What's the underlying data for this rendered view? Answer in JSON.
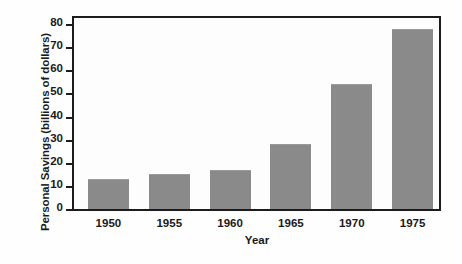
{
  "chart_data": {
    "type": "bar",
    "title": "",
    "xlabel": "Year",
    "ylabel": "Personal Savings (billions of dollars)",
    "categories": [
      "1950",
      "1955",
      "1960",
      "1965",
      "1970",
      "1975"
    ],
    "values": [
      13,
      15,
      17,
      28,
      54,
      78
    ],
    "ylim": [
      0,
      80
    ],
    "yticks": [
      "0",
      "10",
      "20",
      "30",
      "40",
      "50",
      "60",
      "70",
      "80"
    ],
    "ytick_values": [
      0,
      10,
      20,
      30,
      40,
      50,
      60,
      70,
      80
    ],
    "grid": false,
    "legend": "none",
    "bar_color": "#8a8a8a",
    "axis_color": "#1c1c1c",
    "background_color": "#fefefe"
  }
}
